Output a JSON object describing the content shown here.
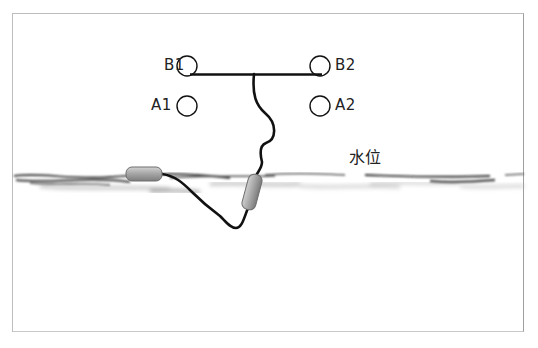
{
  "diagram": {
    "type": "water-level-float-sensor-schematic",
    "electrodes": [
      {
        "id": "B1",
        "label": "B1",
        "cx": 187,
        "cy": 66,
        "r": 10
      },
      {
        "id": "B2",
        "label": "B2",
        "cx": 320,
        "cy": 66,
        "r": 10
      },
      {
        "id": "A1",
        "label": "A1",
        "cx": 187,
        "cy": 106,
        "r": 10
      },
      {
        "id": "A2",
        "label": "A2",
        "cx": 320,
        "cy": 106,
        "r": 10
      }
    ],
    "connector_bar": {
      "x1": 190,
      "x2": 322,
      "y": 74
    },
    "water_level_label": "水位",
    "water_line_y": 176,
    "floats": [
      {
        "name": "left-float",
        "cx": 145,
        "cy": 174,
        "w": 36,
        "h": 14,
        "rotate": 0
      },
      {
        "name": "right-float",
        "cx": 252,
        "cy": 192,
        "w": 14,
        "h": 36,
        "rotate": 15
      }
    ],
    "colors": {
      "line": "#111111",
      "float": "#a6a6a6",
      "float_edge": "#6e6e6e",
      "frame": "#bdbdbd"
    }
  }
}
